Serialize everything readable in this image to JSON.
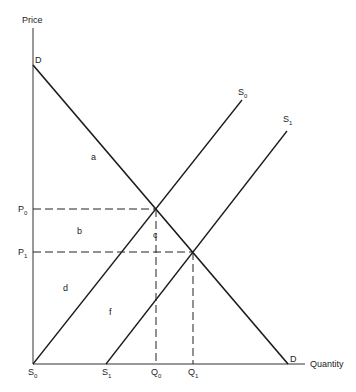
{
  "axes": {
    "y_label": "Price",
    "x_label": "Quantity"
  },
  "curves": {
    "demand": {
      "label_top": "D",
      "label_bottom": "D"
    },
    "supply0": {
      "label": "S",
      "sub": "0"
    },
    "supply1": {
      "label": "S",
      "sub": "1"
    }
  },
  "price_ticks": [
    {
      "label": "P",
      "sub": "0"
    },
    {
      "label": "P",
      "sub": "1"
    }
  ],
  "quantity_ticks": [
    {
      "label": "S",
      "sub": "0"
    },
    {
      "label": "S",
      "sub": "1"
    },
    {
      "label": "Q",
      "sub": "0"
    },
    {
      "label": "Q",
      "sub": "1"
    }
  ],
  "areas": {
    "a": "a",
    "b": "b",
    "c": "c",
    "d": "d",
    "f": "f"
  },
  "colors": {
    "line": "#1a1a1a",
    "background": "#ffffff"
  }
}
